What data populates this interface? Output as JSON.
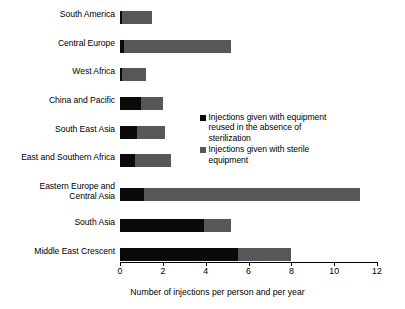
{
  "chart_data": {
    "type": "bar",
    "orientation": "horizontal",
    "stacked": true,
    "title": "",
    "xlabel": "Number of injections per person and per year",
    "ylabel": "",
    "xlim": [
      0,
      12
    ],
    "xticks": [
      0,
      2,
      4,
      6,
      8,
      10,
      12
    ],
    "xtick_labels": [
      "0",
      "2",
      "4",
      "6",
      "8",
      "10",
      "12"
    ],
    "grid": false,
    "legend_position": "inside-middle-right",
    "categories": [
      "South America",
      "Central Europe",
      "West Africa",
      "China and Pacific",
      "South East Asia",
      "East and Southern Africa",
      "Eastern Europe and\nCentral Asia",
      "South Asia",
      "Middle East Crescent"
    ],
    "series": [
      {
        "name": "Injections given with equipment reused in the absence of sterilization",
        "color": "#0a0a0a",
        "values": [
          0.1,
          0.2,
          0.1,
          1.0,
          0.8,
          0.7,
          1.1,
          3.9,
          5.5
        ]
      },
      {
        "name": "Injections given with sterile equipment",
        "color": "#57575a",
        "values": [
          1.4,
          5.0,
          1.1,
          1.0,
          1.3,
          1.7,
          10.1,
          1.3,
          2.5
        ]
      }
    ],
    "totals": [
      1.5,
      5.2,
      1.2,
      2.0,
      2.1,
      2.4,
      11.2,
      5.2,
      8.0
    ]
  },
  "legend": {
    "entries": [
      {
        "label": "Injections given with equipment reused in the absence of sterilization",
        "swatch": "square-black"
      },
      {
        "label": "Injections given with sterile equipment",
        "swatch": "square-gray"
      }
    ]
  },
  "axis": {
    "title": "Number of injections per person and per year"
  }
}
